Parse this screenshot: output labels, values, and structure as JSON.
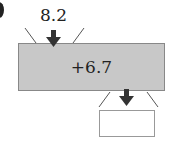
{
  "diagram": {
    "input_value": "8.2",
    "operation": "+6.7",
    "output_value": "",
    "colors": {
      "machine_fill": "#c8c8c8",
      "arrow": "#333333"
    }
  }
}
